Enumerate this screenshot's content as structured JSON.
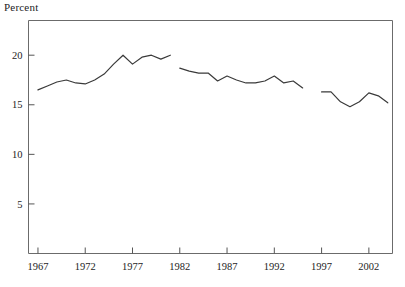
{
  "chart_data": {
    "type": "line",
    "title": "",
    "subtitle": "",
    "ylabel": "Percent",
    "xlabel": "",
    "ylim": [
      0,
      23.5
    ],
    "xlim": [
      1966.0,
      2004.5
    ],
    "yticks": [
      5,
      10,
      15,
      20
    ],
    "ytick_labels": [
      "5",
      "10",
      "15",
      "20"
    ],
    "xticks": [
      1967,
      1972,
      1977,
      1982,
      1987,
      1992,
      1997,
      2002
    ],
    "xtick_labels": [
      "1967",
      "1972",
      "1977",
      "1982",
      "1987",
      "1992",
      "1997",
      "2002"
    ],
    "grid": false,
    "legend": null,
    "legend_position": "none",
    "line_color": "#3a3a3a",
    "frame_color": "#6b6b6b",
    "series": [
      {
        "name": "segment-1",
        "x": [
          1967,
          1968,
          1969,
          1970,
          1971,
          1972,
          1973,
          1974,
          1975,
          1976,
          1977,
          1978,
          1979,
          1980,
          1981
        ],
        "values": [
          16.5,
          16.9,
          17.3,
          17.5,
          17.2,
          17.1,
          17.5,
          18.1,
          19.1,
          20.0,
          19.1,
          19.8,
          20.0,
          19.6,
          20.0
        ]
      },
      {
        "name": "segment-2",
        "x": [
          1982,
          1983,
          1984,
          1985,
          1986,
          1987,
          1988,
          1989,
          1990,
          1991,
          1992,
          1993,
          1994,
          1995
        ],
        "values": [
          18.7,
          18.4,
          18.2,
          18.2,
          17.4,
          17.9,
          17.5,
          17.2,
          17.2,
          17.4,
          17.9,
          17.2,
          17.4,
          16.7
        ]
      },
      {
        "name": "segment-3",
        "x": [
          1997,
          1998,
          1999,
          2000,
          2001,
          2002,
          2003,
          2004
        ],
        "values": [
          16.3,
          16.3,
          15.3,
          14.8,
          15.3,
          16.2,
          15.9,
          15.2
        ]
      }
    ],
    "max_value": 20.4,
    "min_value": 14.8
  }
}
